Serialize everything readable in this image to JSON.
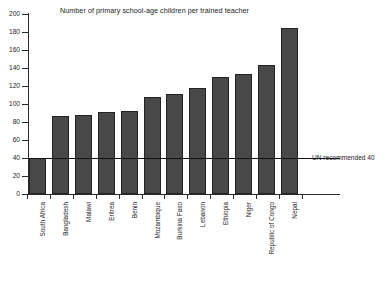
{
  "chart_data": {
    "type": "bar",
    "title": "Number of primary school-age children per trained teacher",
    "xlabel": "",
    "ylabel": "",
    "ylim": [
      0,
      200
    ],
    "yticks": [
      0,
      20,
      40,
      60,
      80,
      100,
      120,
      140,
      160,
      180,
      200
    ],
    "grid": false,
    "legend": "none",
    "categories": [
      "South Africa",
      "Bangladesh",
      "Malawi",
      "Eritrea",
      "Benin",
      "Mozambique",
      "Burkina Faso",
      "Lebanon",
      "Ethiopia",
      "Niger",
      "Republic of Congo",
      "Nepal"
    ],
    "values": [
      40,
      87,
      88,
      91,
      92,
      108,
      111,
      118,
      130,
      133,
      143,
      184
    ],
    "bar_color": "#484848",
    "bar_edge_color": "#232323",
    "annotations": [
      {
        "name": "un-recommended-line",
        "label": "UN recommended 40",
        "value": 40,
        "orientation": "horizontal",
        "color": "#111111"
      }
    ]
  }
}
